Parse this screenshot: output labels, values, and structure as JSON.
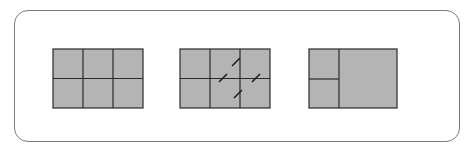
{
  "diagram": {
    "colors": {
      "cell_fill": "#b4b4b4",
      "grid_line": "#2a2a2a",
      "frame": "#7a7a7a",
      "background": "#ffffff"
    },
    "panels": [
      {
        "name": "original-grid",
        "rows": 2,
        "cols": 3,
        "x": 53,
        "y": 49,
        "w": 90,
        "h": 59
      },
      {
        "name": "marked-grid",
        "rows": 2,
        "cols": 3,
        "x": 180,
        "y": 49,
        "w": 90,
        "h": 59,
        "marks": [
          [
            236,
            62
          ],
          [
            223,
            78
          ],
          [
            256,
            78
          ],
          [
            238,
            94
          ]
        ]
      },
      {
        "name": "merged-grid",
        "x": 309,
        "y": 49,
        "w": 88,
        "h": 59,
        "split_x": 339,
        "split_y": 79
      }
    ]
  }
}
